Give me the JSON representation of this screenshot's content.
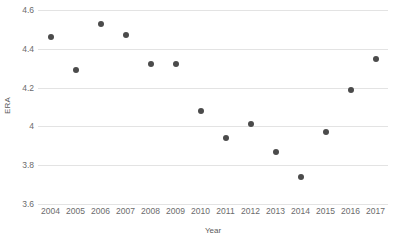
{
  "chart_data": {
    "type": "scatter",
    "title": "",
    "xlabel": "Year",
    "ylabel": "ERA",
    "x": [
      2004,
      2005,
      2006,
      2007,
      2008,
      2009,
      2010,
      2011,
      2012,
      2013,
      2014,
      2015,
      2016,
      2017
    ],
    "values": [
      4.46,
      4.29,
      4.53,
      4.47,
      4.32,
      4.32,
      4.08,
      3.94,
      4.01,
      3.87,
      3.74,
      3.97,
      4.19,
      4.35
    ],
    "categories": [
      "2004",
      "2005",
      "2006",
      "2007",
      "2008",
      "2009",
      "2010",
      "2011",
      "2012",
      "2013",
      "2014",
      "2015",
      "2016",
      "2017"
    ],
    "xtick_labels": [
      "2004",
      "2005",
      "2006",
      "2007",
      "2008",
      "2009",
      "2010",
      "2011",
      "2012",
      "2013",
      "2014",
      "2015",
      "2016",
      "2017"
    ],
    "ytick_labels": [
      "4.6",
      "4.4",
      "4.2",
      "4",
      "3.8",
      "3.6"
    ],
    "yticks": [
      4.6,
      4.4,
      4.2,
      4.0,
      3.8,
      3.6
    ],
    "ylim": [
      3.6,
      4.6
    ],
    "xlim": [
      2003.5,
      2017.5
    ],
    "grid": "horizontal",
    "legend": "none",
    "marker_color": "#4b4b4b",
    "gridline_color": "#e3e3e3",
    "axis_text_color": "#6b6b6b",
    "background_color": "#ffffff",
    "series": [
      {
        "name": "ERA",
        "points": [
          {
            "x": "2004",
            "y": 4.46
          },
          {
            "x": "2005",
            "y": 4.29
          },
          {
            "x": "2006",
            "y": 4.53
          },
          {
            "x": "2007",
            "y": 4.47
          },
          {
            "x": "2008",
            "y": 4.32
          },
          {
            "x": "2009",
            "y": 4.32
          },
          {
            "x": "2010",
            "y": 4.08
          },
          {
            "x": "2011",
            "y": 3.94
          },
          {
            "x": "2012",
            "y": 4.01
          },
          {
            "x": "2013",
            "y": 3.87
          },
          {
            "x": "2014",
            "y": 3.74
          },
          {
            "x": "2015",
            "y": 3.97
          },
          {
            "x": "2016",
            "y": 4.19
          },
          {
            "x": "2017",
            "y": 4.35
          }
        ]
      }
    ]
  }
}
